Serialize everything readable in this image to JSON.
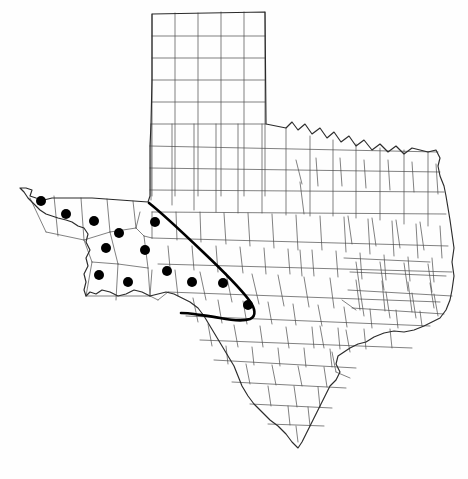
{
  "figure": {
    "kind": "distribution-map",
    "region": "Texas",
    "subdivision_label": "counties",
    "background_color": "#fefefe",
    "county_line_color": "#4a4a4a",
    "state_outline_color": "#2b2b2b",
    "range_boundary_color": "#000000",
    "dot_color": "#000000",
    "width": 468,
    "height": 479,
    "caption": ""
  },
  "legend": {
    "dot_label": "occurrence record",
    "boundary_label": "range boundary"
  },
  "map_data": {
    "type": "point-distribution",
    "units": "pixels",
    "dot_radius": 5,
    "dot_count": 13,
    "dots": [
      {
        "id": "dot-1",
        "x": 41,
        "y": 201
      },
      {
        "id": "dot-2",
        "x": 66,
        "y": 214
      },
      {
        "id": "dot-3",
        "x": 94,
        "y": 221
      },
      {
        "id": "dot-4",
        "x": 119,
        "y": 233
      },
      {
        "id": "dot-5",
        "x": 155,
        "y": 222
      },
      {
        "id": "dot-6",
        "x": 106,
        "y": 248
      },
      {
        "id": "dot-7",
        "x": 145,
        "y": 250
      },
      {
        "id": "dot-8",
        "x": 99,
        "y": 275
      },
      {
        "id": "dot-9",
        "x": 128,
        "y": 282
      },
      {
        "id": "dot-10",
        "x": 167,
        "y": 271
      },
      {
        "id": "dot-11",
        "x": 192,
        "y": 282
      },
      {
        "id": "dot-12",
        "x": 223,
        "y": 283
      },
      {
        "id": "dot-13",
        "x": 248,
        "y": 305
      }
    ],
    "range_boundary": {
      "closed": true,
      "description": "bold outline enclosing the western occurrence cluster"
    }
  }
}
